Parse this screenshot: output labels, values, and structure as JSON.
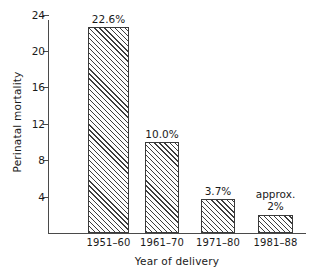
{
  "chart_data": {
    "type": "bar",
    "title": "",
    "xlabel": "Year of delivery",
    "ylabel": "Perinatal mortality",
    "categories": [
      "1951–60",
      "1961–70",
      "1971–80",
      "1981–88"
    ],
    "values": [
      22.6,
      10.0,
      3.7,
      2.0
    ],
    "data_labels": [
      "22.6%",
      "10.0%",
      "3.7%",
      "2%"
    ],
    "annotations": [
      "",
      "",
      "",
      "approx."
    ],
    "ylim": [
      0,
      24
    ],
    "yticks": [
      4,
      8,
      12,
      16,
      20,
      24
    ],
    "ytick_labels": [
      "4",
      "8",
      "12",
      "16",
      "20",
      "24"
    ],
    "grid": false,
    "legend": false,
    "bar_fill": "hatched-diagonal",
    "axis_color": "#4a4a4a",
    "bar_edge_color": "#3a3a3a"
  }
}
